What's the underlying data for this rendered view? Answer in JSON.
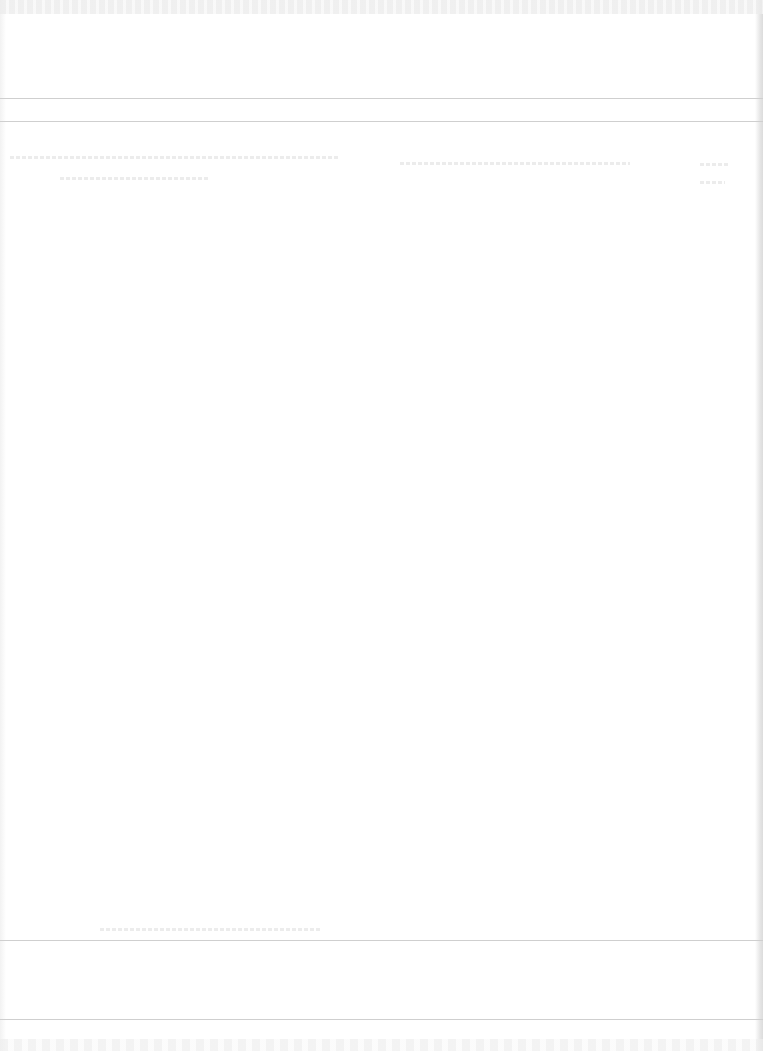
{
  "document": {
    "type": "overexposed-scanned-form",
    "legible_text": "",
    "note": "Text content is too faded to read"
  },
  "rules": [
    {
      "name": "header-rule-top",
      "y": 98
    },
    {
      "name": "header-rule-bottom",
      "y": 121
    },
    {
      "name": "footer-rule-top",
      "y": 940
    },
    {
      "name": "footer-rule-bottom",
      "y": 1019
    }
  ],
  "colors": {
    "paper": "#ffffff",
    "rule": "#cfcfcf",
    "faded_text": "#ececec"
  }
}
